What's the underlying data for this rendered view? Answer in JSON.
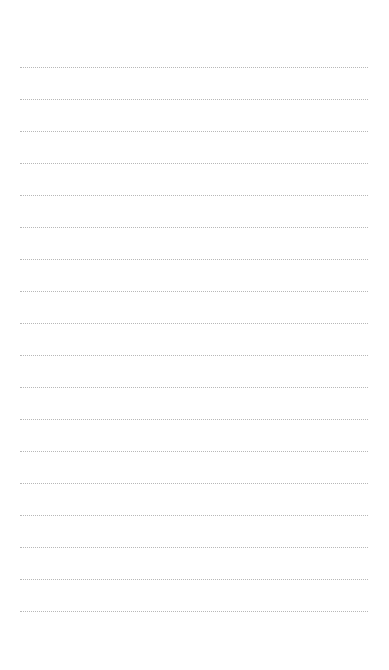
{
  "page": {
    "type": "lined-notepad",
    "background_color": "#ffffff",
    "line_color": "#b8b8b8",
    "line_style": "dotted",
    "line_count": 18,
    "first_line_y": 67,
    "line_spacing": 32,
    "lines": [
      "",
      "",
      "",
      "",
      "",
      "",
      "",
      "",
      "",
      "",
      "",
      "",
      "",
      "",
      "",
      "",
      "",
      ""
    ]
  }
}
